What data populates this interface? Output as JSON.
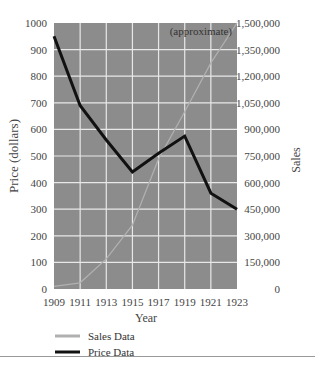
{
  "chart_data": {
    "type": "line",
    "title": "",
    "annotation": "(approximate)",
    "xlabel": "Year",
    "ylabel_left": "Price (dollars)",
    "ylabel_right": "Sales",
    "x": [
      1909,
      1911,
      1913,
      1915,
      1917,
      1919,
      1921,
      1923
    ],
    "x_ticks": [
      "1909",
      "1911",
      "1913",
      "1915",
      "1917",
      "1919",
      "1921",
      "1923"
    ],
    "y_left_ticks": [
      "0",
      "100",
      "200",
      "300",
      "400",
      "500",
      "600",
      "700",
      "800",
      "900",
      "1000"
    ],
    "y_right_ticks": [
      "0",
      "150,000",
      "300,000",
      "450,000",
      "600,000",
      "750,000",
      "900,000",
      "1,050,000",
      "1,200,000",
      "1,350,000",
      "1,500,000"
    ],
    "ylim_left": [
      0,
      1000
    ],
    "ylim_right": [
      0,
      1500000
    ],
    "series": [
      {
        "name": "Sales Data",
        "axis": "right",
        "color": "#b0b0b0",
        "values": [
          15000,
          35000,
          170000,
          360000,
          735000,
          1000000,
          1275000,
          1500000
        ]
      },
      {
        "name": "Price Data",
        "axis": "left",
        "color": "#111111",
        "values": [
          950,
          690,
          560,
          440,
          510,
          575,
          360,
          300
        ]
      }
    ],
    "grid": true,
    "plot_background": "#8c8c8c",
    "legend_position": "bottom-left"
  },
  "legend": [
    {
      "label": "Sales Data",
      "color": "#b0b0b0"
    },
    {
      "label": "Price Data",
      "color": "#111111"
    }
  ]
}
